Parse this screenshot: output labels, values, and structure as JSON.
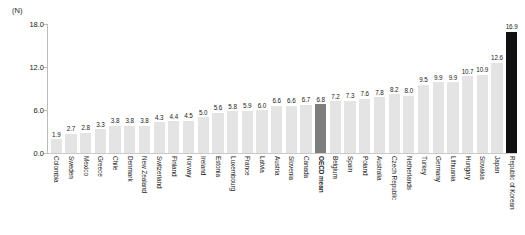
{
  "chart_data": {
    "type": "bar",
    "title": "",
    "xlabel": "",
    "ylabel": "(N)",
    "ylim": [
      0,
      18
    ],
    "yticks": [
      "18.0",
      "12.0",
      "6.0",
      "0.0"
    ],
    "ytick_values": [
      18.0,
      12.0,
      6.0,
      0.0
    ],
    "grid": false,
    "legend": "none",
    "categories": [
      "Colombia",
      "Sweden",
      "Mexico",
      "Greece",
      "Chile",
      "Denmark",
      "New Zealand",
      "Switzerland",
      "Finland",
      "Norway",
      "Ireland",
      "Estonia",
      "Luxembourg",
      "France",
      "Latvia",
      "Austria",
      "Slovenia",
      "Canada",
      "OECD mean",
      "Belgium",
      "Spain",
      "Poland",
      "Australia",
      "Czech Republic",
      "Netherlands",
      "Turkey",
      "Germany",
      "Lithuania",
      "Hungary",
      "Slovakia",
      "Japan",
      "Republic of Korean"
    ],
    "values": [
      1.9,
      2.7,
      2.8,
      3.3,
      3.8,
      3.8,
      3.8,
      4.3,
      4.4,
      4.5,
      5.0,
      5.6,
      5.8,
      5.9,
      6.0,
      6.6,
      6.6,
      6.7,
      6.8,
      7.2,
      7.3,
      7.6,
      7.8,
      8.2,
      8.0,
      9.5,
      9.9,
      9.9,
      10.7,
      10.9,
      12.6,
      16.9
    ],
    "value_labels": [
      "1.9",
      "2.7",
      "2.8",
      "3.3",
      "3.8",
      "3.8",
      "3.8",
      "4.3",
      "4.4",
      "4.5",
      "5.0",
      "5.6",
      "5.8",
      "5.9",
      "6.0",
      "6.6",
      "6.6",
      "6.7",
      "6.8",
      "7.2",
      "7.3",
      "7.6",
      "7.8",
      "8.2",
      "8.0",
      "9.5",
      "9.9",
      "9.9",
      "10.7",
      "10.9",
      "12.6",
      "16.9"
    ],
    "bar_styles": [
      "normal",
      "normal",
      "normal",
      "normal",
      "normal",
      "normal",
      "normal",
      "normal",
      "normal",
      "normal",
      "normal",
      "normal",
      "normal",
      "normal",
      "normal",
      "normal",
      "normal",
      "normal",
      "mean",
      "normal",
      "normal",
      "normal",
      "normal",
      "normal",
      "normal",
      "normal",
      "normal",
      "normal",
      "normal",
      "normal",
      "normal",
      "highlight"
    ],
    "colors": {
      "bar": "#e4e4e4",
      "mean": "#7d7d7d",
      "highlight": "#111111",
      "axis": "#bdbdbd",
      "text": "#1a1a1a",
      "background": "#ffffff"
    }
  }
}
